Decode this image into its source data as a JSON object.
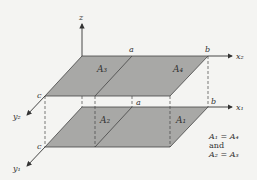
{
  "diagram": {
    "axes": {
      "z": "z",
      "x1": "x₁",
      "x2": "x₂",
      "y1": "y₁",
      "y2": "y₂"
    },
    "point_labels": {
      "a_top": "a",
      "b_top": "b",
      "a_bottom": "a",
      "b_bottom": "b",
      "c_top": "c",
      "c_bottom": "c"
    },
    "regions": {
      "A1": "A₁",
      "A2": "A₂",
      "A3": "A₃",
      "A4": "A₄"
    },
    "note": {
      "line1": "A₁ = A₄",
      "line2": "and",
      "line3": "A₂ = A₃"
    },
    "colors": {
      "fill": "#a8a8a6",
      "stroke": "#333333",
      "background": "#f4f4f2"
    }
  }
}
